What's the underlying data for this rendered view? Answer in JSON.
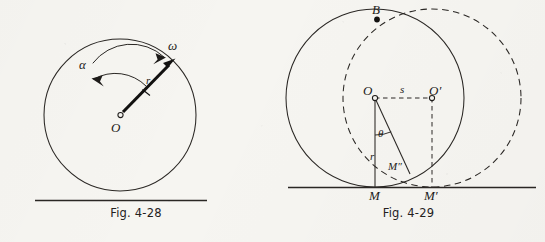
{
  "page": {
    "background_color": "#f6f5f1",
    "ink_color": "#1d1b19",
    "width": 545,
    "height": 242
  },
  "figures": [
    {
      "id": "fig-4-28",
      "caption": "Fig. 4-28",
      "description": "Rolling disk with angular velocity and angular acceleration arcs",
      "elements": {
        "center_label": "O",
        "radius_label": "r",
        "angular_velocity_label": "ω",
        "angular_acceleration_label": "α"
      },
      "geometry": {
        "circle_center": [
          120,
          115
        ],
        "circle_radius": 76,
        "ground_line_y": 200,
        "ground_line_x1": 35,
        "ground_line_x2": 207,
        "radius_arrow_angle_deg": 45,
        "omega_arc_direction": "clockwise",
        "alpha_arc_direction": "counterclockwise"
      }
    },
    {
      "id": "fig-4-29",
      "caption": "Fig. 4-29",
      "description": "Cycloid construction: solid circle at O tangent at M, dashed displaced circle at O-prime tangent at M-prime",
      "elements": {
        "top_point_label": "B",
        "center_label": "O",
        "displaced_center_label": "O′",
        "displacement_label": "s",
        "radius_label": "r",
        "angle_label": "θ",
        "contact_label": "M",
        "displaced_contact_label": "M′",
        "trace_point_label": "M″"
      },
      "geometry": {
        "circle_center": [
          375,
          98
        ],
        "circle_radius": 89,
        "displaced_center": [
          432,
          98
        ],
        "displacement_s": 57,
        "ground_line_y": 187,
        "ground_line_x1": 288,
        "ground_line_x2": 536,
        "contact_point": [
          375,
          187
        ],
        "displaced_contact_point": [
          432,
          187
        ],
        "trace_point": [
          409,
          173
        ],
        "top_point": [
          377,
          20
        ]
      }
    }
  ]
}
